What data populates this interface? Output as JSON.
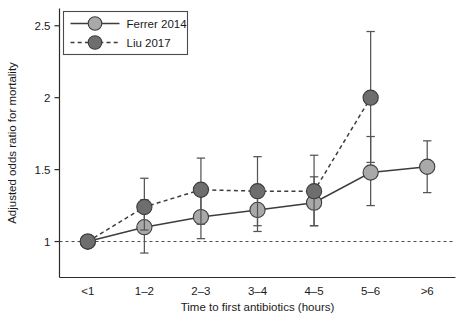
{
  "chart_data": {
    "type": "line",
    "title": "",
    "xlabel": "Time to first antibiotics (hours)",
    "ylabel": "Adjusted odds ratio for mortality",
    "categories": [
      "<1",
      "1–2",
      "2–3",
      "3–4",
      "4–5",
      "5–6",
      ">6"
    ],
    "ylim": [
      0.75,
      2.62
    ],
    "yticks": [
      1,
      1.5,
      2,
      2.5
    ],
    "ytick_labels": [
      "1",
      "1.5",
      "2",
      "2.5"
    ],
    "grid": false,
    "reference_line": {
      "y": 1,
      "style": "dashed"
    },
    "legend": {
      "position": "top-left",
      "entries": [
        {
          "name": "Ferrer 2014",
          "style": "solid",
          "marker_color": "#a9a9a9"
        },
        {
          "name": "Liu 2017",
          "style": "dashed",
          "marker_color": "#6e6e6e"
        }
      ]
    },
    "series": [
      {
        "name": "Ferrer 2014",
        "style": "solid",
        "marker_color": "#a9a9a9",
        "x": [
          "<1",
          "1–2",
          "2–3",
          "3–4",
          "4–5",
          "5–6",
          ">6"
        ],
        "values": [
          1.0,
          1.1,
          1.17,
          1.22,
          1.27,
          1.48,
          1.52
        ],
        "ci_low": [
          1.0,
          0.92,
          1.02,
          1.07,
          1.11,
          1.25,
          1.34
        ],
        "ci_high": [
          1.0,
          1.29,
          1.33,
          1.39,
          1.45,
          1.73,
          1.7
        ]
      },
      {
        "name": "Liu 2017",
        "style": "dashed",
        "marker_color": "#6e6e6e",
        "x": [
          "<1",
          "1–2",
          "2–3",
          "3–4",
          "4–5",
          "5–6"
        ],
        "values": [
          1.0,
          1.24,
          1.36,
          1.35,
          1.35,
          2.0
        ],
        "ci_low": [
          1.0,
          1.08,
          1.12,
          1.11,
          1.11,
          1.55
        ],
        "ci_high": [
          1.0,
          1.44,
          1.58,
          1.59,
          1.6,
          2.46
        ]
      }
    ]
  },
  "colors": {
    "ferrer_marker": "#a9a9a9",
    "liu_marker": "#6e6e6e",
    "line": "#3d3d3d",
    "axis": "#2b2b2b",
    "text": "#1a1a1a",
    "background": "#ffffff"
  }
}
